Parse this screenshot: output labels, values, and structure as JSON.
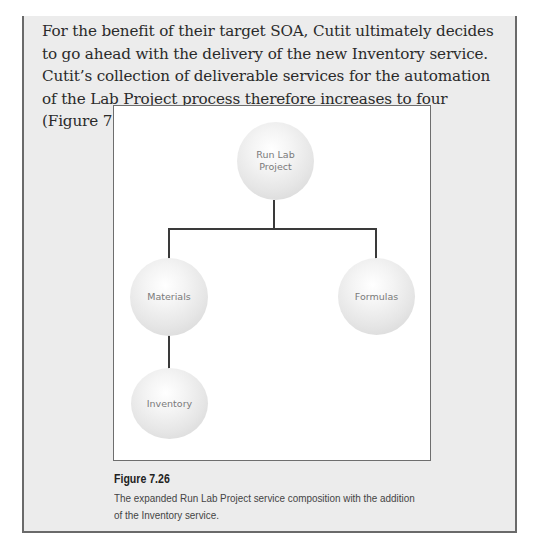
{
  "body": {
    "paragraph": "For the benefit of their target SOA, Cutit ultimately decides to go ahead with the delivery of the new Inventory service. Cutit’s collection of deliverable services for the automation of the Lab Project process therefore increases to four (Figure 7.26)."
  },
  "figure": {
    "nodes": [
      {
        "id": "run-lab-project",
        "label": "Run Lab\nProject"
      },
      {
        "id": "materials",
        "label": "Materials"
      },
      {
        "id": "formulas",
        "label": "Formulas"
      },
      {
        "id": "inventory",
        "label": "Inventory"
      }
    ],
    "caption_title": "Figure 7.26",
    "caption_text": "The expanded Run Lab Project service composition with the addition of the Inventory service."
  },
  "colors": {
    "box_background": "#ececec",
    "box_border": "#6a6a6a",
    "sphere_text": "#7a7a7a",
    "connector": "#3a3a3a"
  }
}
